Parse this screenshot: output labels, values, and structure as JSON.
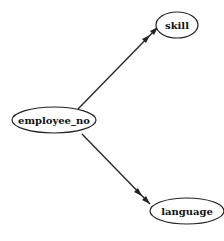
{
  "diagram": {
    "type": "directed-graph",
    "nodes": [
      {
        "id": "employee_no",
        "label": "employee_no",
        "cx": 54,
        "cy": 120,
        "rx": 42,
        "ry": 13
      },
      {
        "id": "skill",
        "label": "skill",
        "cx": 177,
        "cy": 25,
        "rx": 21,
        "ry": 13
      },
      {
        "id": "language",
        "label": "language",
        "cx": 187,
        "cy": 211,
        "rx": 37,
        "ry": 13
      }
    ],
    "edges": [
      {
        "from": "employee_no",
        "to": "skill",
        "arrow": "double"
      },
      {
        "from": "employee_no",
        "to": "language",
        "arrow": "double"
      }
    ]
  }
}
